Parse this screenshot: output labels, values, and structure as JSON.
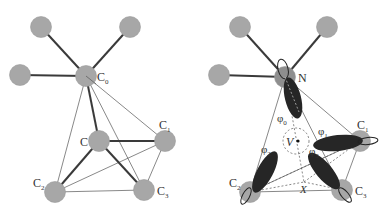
{
  "figure": {
    "left_panel": {
      "labels": {
        "c0": {
          "base": "C",
          "sub": "0"
        },
        "c": {
          "base": "C",
          "sub": ""
        },
        "c1": {
          "base": "C",
          "sub": "1"
        },
        "c2": {
          "base": "C",
          "sub": "2"
        },
        "c3": {
          "base": "C",
          "sub": "3"
        }
      }
    },
    "right_panel": {
      "labels": {
        "n": {
          "base": "N",
          "sub": ""
        },
        "c1": {
          "base": "C",
          "sub": "1"
        },
        "c2": {
          "base": "C",
          "sub": "2"
        },
        "c3": {
          "base": "C",
          "sub": "3"
        },
        "v": "V",
        "x": "X"
      },
      "orbitals": {
        "phi0": {
          "base": "φ",
          "sub": "0"
        },
        "phi1": {
          "base": "φ",
          "sub": "1"
        },
        "phi2": {
          "base": "φ",
          "sub": "2"
        },
        "phi3": {
          "base": "φ",
          "sub": "3"
        }
      }
    },
    "colors": {
      "atom": "#a7a7a7",
      "bond": "#3a3a3a",
      "lobe": "#262626"
    }
  }
}
